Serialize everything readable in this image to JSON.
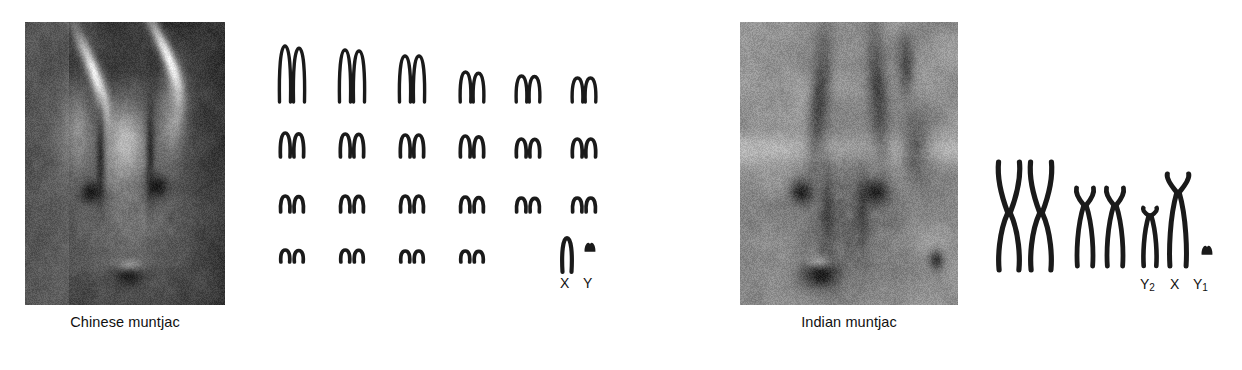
{
  "figure": {
    "background_color": "#ffffff",
    "ink_color": "#1a1a1a"
  },
  "panels": [
    {
      "id": "chinese",
      "caption": "Chinese muntjac",
      "photo_alt": "Chinese muntjac deer head with short antlers",
      "karyotype": {
        "diploid_note": "2n = 46",
        "rows": [
          {
            "row": 1,
            "pairs": 6,
            "shape": "submetacentric",
            "heights": [
              56,
              52,
              46,
              30,
              26,
              24
            ]
          },
          {
            "row": 2,
            "pairs": 6,
            "shape": "acrocentric",
            "heights": [
              24,
              23,
              22,
              21,
              18,
              18
            ]
          },
          {
            "row": 3,
            "pairs": 6,
            "shape": "acrocentric",
            "heights": [
              16,
              16,
              16,
              15,
              14,
              14
            ]
          },
          {
            "row": 4,
            "pairs": 4,
            "shape": "acrocentric",
            "heights": [
              12,
              12,
              11,
              11
            ]
          }
        ],
        "sex_chromosomes": [
          {
            "label": "X",
            "height": 34,
            "shape": "submetacentric"
          },
          {
            "label": "Y",
            "height": 12,
            "shape": "dot"
          }
        ]
      }
    },
    {
      "id": "indian",
      "caption": "Indian muntjac",
      "photo_alt": "Indian muntjac deer head with long pedicle antlers",
      "karyotype": {
        "diploid_note": "2n = 7 (male)",
        "autosome_pairs": [
          {
            "pair": 1,
            "height": 108,
            "shape": "metacentric"
          },
          {
            "pair": 2,
            "height": 78,
            "shape": "submetacentric"
          }
        ],
        "sex_chromosomes": [
          {
            "label": "Y",
            "sub": "2",
            "height": 58,
            "shape": "submetacentric"
          },
          {
            "label": "X",
            "sub": "",
            "height": 92,
            "shape": "submetacentric"
          },
          {
            "label": "Y",
            "sub": "1",
            "height": 12,
            "shape": "dot"
          }
        ]
      }
    }
  ]
}
